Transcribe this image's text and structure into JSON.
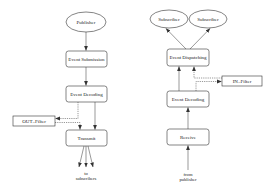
{
  "diagram": {
    "type": "flowchart",
    "colors": {
      "stroke": "#333333",
      "text": "#222222",
      "background": "#ffffff"
    },
    "publisher_side": {
      "nodes": {
        "publisher": "Publisher",
        "event_submission": "Event Submission",
        "event_decoding": "Event Decoding",
        "out_filter": "OUT–Filter",
        "transmit": "Transmit"
      },
      "output_label_line1": "to",
      "output_label_line2": "subscribers"
    },
    "subscriber_side": {
      "nodes": {
        "subscriber_1": "Subscriber",
        "subscriber_2": "Subscriber",
        "event_dispatching": "Event Dispatching",
        "in_filter": "IN–Filter",
        "event_decoding": "Event Decoding",
        "receive": "Receive"
      },
      "input_label_line1": "from",
      "input_label_line2": "publisher"
    },
    "edges": [
      {
        "from": "Publisher",
        "to": "Event Submission",
        "style": "solid"
      },
      {
        "from": "Event Submission",
        "to": "Event Decoding",
        "style": "solid"
      },
      {
        "from": "Event Decoding",
        "to": "Transmit",
        "style": "solid"
      },
      {
        "from": "Event Decoding",
        "to": "OUT–Filter",
        "style": "dashed"
      },
      {
        "from": "OUT–Filter",
        "to": "Transmit",
        "style": "dashed"
      },
      {
        "from": "Transmit",
        "to": "to subscribers",
        "style": "solid",
        "count": 3
      },
      {
        "from": "from publisher",
        "to": "Receive",
        "style": "solid"
      },
      {
        "from": "Receive",
        "to": "Event Decoding",
        "style": "solid"
      },
      {
        "from": "Event Decoding",
        "to": "Event Dispatching",
        "style": "solid"
      },
      {
        "from": "Event Decoding",
        "to": "IN–Filter",
        "style": "dashed"
      },
      {
        "from": "IN–Filter",
        "to": "Event Dispatching",
        "style": "dashed"
      },
      {
        "from": "Event Dispatching",
        "to": "Subscriber",
        "style": "solid",
        "count": 2
      }
    ]
  }
}
